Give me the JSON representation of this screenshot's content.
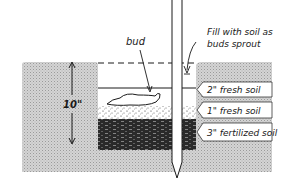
{
  "diagram": {
    "labels": {
      "bud": "bud",
      "fill_line1": "Fill with soil as",
      "fill_line2": "buds sprout",
      "depth": "10\"",
      "layer_top": "2\" fresh soil",
      "layer_mid": "1\" fresh soil",
      "layer_bottom": "3\" fertilized soil"
    },
    "colors": {
      "soil_gray": "#c8c8c8",
      "ink": "#1a1a1a",
      "fertilized": "#2a2a2a",
      "background": "#ffffff"
    }
  }
}
